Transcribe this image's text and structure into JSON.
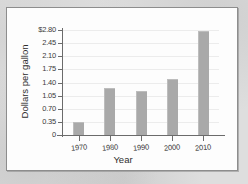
{
  "chart_data": {
    "type": "bar",
    "title": "",
    "xlabel": "Year",
    "ylabel": "Dollars per gallon",
    "categories": [
      "1970",
      "1980",
      "1990",
      "2000",
      "2010"
    ],
    "values": [
      0.35,
      1.25,
      1.17,
      1.49,
      2.78
    ],
    "ylim": [
      0,
      2.8
    ],
    "yticks": [
      0,
      0.35,
      0.7,
      1.05,
      1.4,
      1.75,
      2.1,
      2.45,
      2.8
    ],
    "ytick_labels": [
      "0",
      "0.35",
      "0.70",
      "1.05",
      "1.40",
      "1.75",
      "2.10",
      "2.45",
      "$2.80"
    ],
    "grid": true,
    "legend": false,
    "bar_color": "#a9a9a9",
    "axis_color": "#6b6b6b",
    "grid_color": "#ececec",
    "panel_color": "#fdfdfd",
    "background_color": "#dedede"
  }
}
